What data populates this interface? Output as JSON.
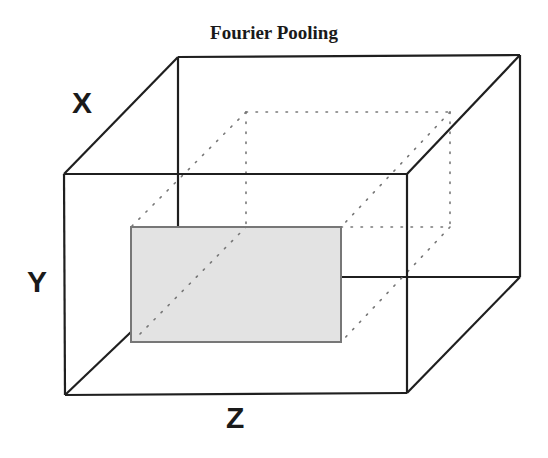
{
  "figure": {
    "title": "Fourier Pooling",
    "axes": {
      "x": "X",
      "y": "Y",
      "z": "Z"
    },
    "colors": {
      "edge": "#1f1f1f",
      "dotted": "#777777",
      "plane_fill": "#e3e3e3",
      "plane_border": "#777777"
    }
  }
}
